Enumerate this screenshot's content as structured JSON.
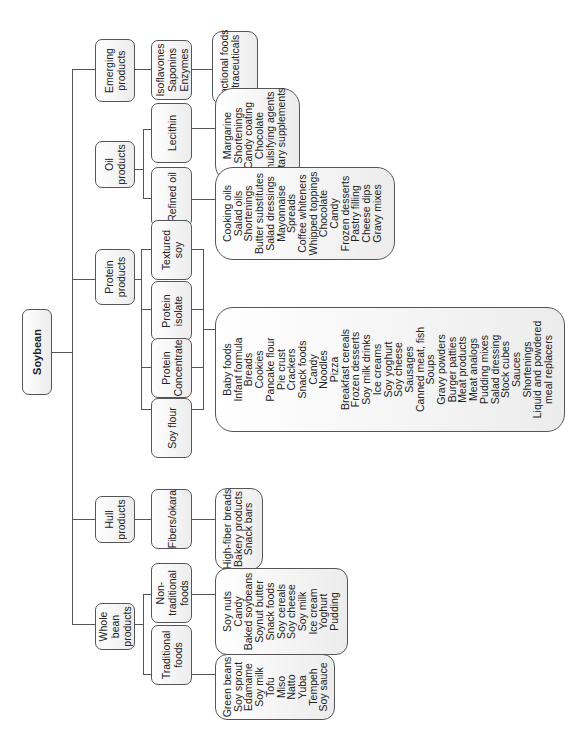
{
  "root": {
    "label": "Soybean"
  },
  "categories": {
    "emerging": {
      "label": "Emerging\nproducts",
      "child": "Isoflavones\nSaponins\nEnzymes",
      "uses": [
        "Functional foods",
        "Nutraceuticals"
      ]
    },
    "oil": {
      "label": "Oil\nproducts",
      "lecithin": {
        "label": "Lecithin",
        "uses": [
          "Margarine",
          "Shortenings",
          "Candy coating",
          "Chocolate",
          "Emulsifying agents",
          "Dietary supplements"
        ]
      },
      "refined": {
        "label": "Refined oil",
        "uses": [
          "Cooking oils",
          "Salad oils",
          "Shortenings",
          "Butter substitutes",
          "Salad dressings",
          "Mayonnaise",
          "Spreads",
          "Coffee whiteners",
          "Whipped toppings",
          "Chocolate",
          "Candy",
          "Frozen desserts",
          "Pastry filling",
          "Cheese dips",
          "Gravy mixes"
        ]
      }
    },
    "protein": {
      "label": "Protein\nproducts",
      "children": [
        "Textured soy",
        "Protein\nisolate",
        "Protein\nConcentrate",
        "Soy flour"
      ],
      "uses": [
        "Baby foods",
        "Infant formula",
        "Breads",
        "Cookies",
        "Pancake flour",
        "Pie crust",
        "Crackers",
        "Snack foods",
        "Candy",
        "Noodles",
        "Pizza",
        "Breakfast cereals",
        "Frozen desserts",
        "Soy milk drinks",
        "Ice creams",
        "Soy yoghurt",
        "Soy cheese",
        "Sausages",
        "Canned meat, fish",
        "Soups",
        "Gravy powders",
        "Burger patties",
        "Meat products",
        "Meat analogs",
        "Pudding mixes",
        "Salad dressing",
        "Stock cubes",
        "Sauces",
        "Shortenings",
        "Liquid and powdered",
        "meal replacers"
      ]
    },
    "hull": {
      "label": "Hull\nproducts",
      "child": "Fibers/okara",
      "uses": [
        "High-fiber breads",
        "Bakery products",
        "Snack bars"
      ]
    },
    "whole": {
      "label": "Whole\nbean\nproducts",
      "nontraditional": {
        "label": "Non-\ntraditional\nfoods",
        "uses": [
          "Soy nuts",
          "Candy",
          "Baked soybeans",
          "Soynut butter",
          "Snack foods",
          "Soy cereals",
          "Soy cheese",
          "Soy milk",
          "Ice cream",
          "Yoghurt",
          "Pudding"
        ]
      },
      "traditional": {
        "label": "Traditional\nfoods",
        "uses": [
          "Green beans",
          "Soy sprout",
          "Edamame",
          "Soy milk",
          "Tofu",
          "Miso",
          "Natto",
          "Yuba",
          "Tempeh",
          "Soy sauce"
        ]
      }
    }
  },
  "colors": {
    "line": "#555555",
    "box_top": "#ffffff",
    "box_bottom": "#ececec",
    "text": "#222222"
  }
}
